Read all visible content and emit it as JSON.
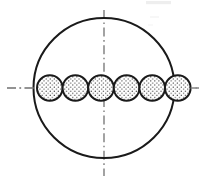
{
  "figure": {
    "name": "cross-section-circle-packing-diagram",
    "type": "engineering-line-drawing",
    "canvas": {
      "width": 205,
      "height": 182
    },
    "background_color": "#ffffff",
    "stroke_color": "#1a1a1a",
    "centerline_color": "#8c8c8c",
    "fill_pattern": "stipple-dots",
    "fill_dot_color": "#2b2b2b",
    "fill_background_color": "#ffffff",
    "outer_boundary": {
      "label": "outer-circle",
      "shape": "ellipse",
      "cx": 104,
      "cy": 88,
      "rx": 70.5,
      "ry": 70,
      "stroke_width": 2,
      "fill": "none"
    },
    "inner_circles": {
      "label": "stippled-circle-row",
      "count": 6,
      "diameter": 25.6,
      "radius": 12.8,
      "cy": 88,
      "tangent": true,
      "stroke_width": 2,
      "centers_x": [
        49.8,
        75.4,
        101.0,
        126.6,
        152.2,
        177.8
      ],
      "row_start_x": 37,
      "row_end_x": 165
    },
    "centerlines": [
      {
        "label": "vertical-centerline",
        "orientation": "vertical",
        "x": 104,
        "y1": 10,
        "y2": 176,
        "style": "dash-dot",
        "stroke_width": 1.6
      },
      {
        "label": "horizontal-centerline",
        "orientation": "horizontal",
        "y": 88,
        "x1": 7,
        "x2": 199,
        "style": "dash-dot",
        "stroke_width": 1.6
      }
    ],
    "artifacts": [
      {
        "label": "scan-smudge-top-right",
        "x": 146,
        "y": 1,
        "width": 26,
        "height": 4,
        "opacity": 0.12
      }
    ]
  }
}
